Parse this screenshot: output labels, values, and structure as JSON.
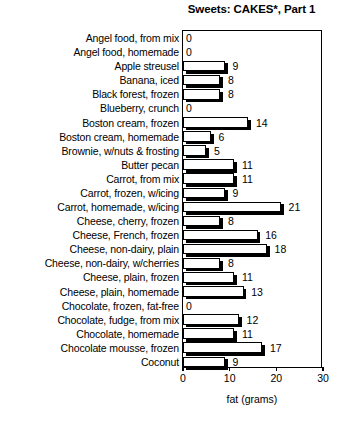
{
  "chart_data": {
    "type": "bar",
    "orientation": "horizontal",
    "title": "Sweets: CAKES*, Part 1",
    "xlabel": "fat (grams)",
    "ylabel": "",
    "xlim": [
      0,
      30
    ],
    "xticks": [
      0,
      10,
      20,
      30
    ],
    "xticklabels": [
      "0",
      "10",
      "20",
      "30"
    ],
    "grid": false,
    "legend": null,
    "categories": [
      "Angel food, from mix",
      "Angel food, homemade",
      "Apple streusel",
      "Banana, iced",
      "Black forest, frozen",
      "Blueberry, crunch",
      "Boston cream, frozen",
      "Boston cream, homemade",
      "Brownie, w/nuts & frosting",
      "Butter pecan",
      "Carrot, from mix",
      "Carrot, frozen, w/icing",
      "Carrot, homemade, w/icing",
      "Cheese, cherry, frozen",
      "Cheese, French, frozen",
      "Cheese, non-dairy, plain",
      "Cheese, non-dairy, w/cherries",
      "Cheese, plain, frozen",
      "Cheese, plain, homemade",
      "Chocolate, frozen, fat-free",
      "Chocolate, fudge, from mix",
      "Chocolate, homemade",
      "Chocolate mousse, frozen",
      "Coconut"
    ],
    "values": [
      0,
      0,
      9,
      8,
      8,
      0,
      14,
      6,
      5,
      11,
      11,
      9,
      21,
      8,
      16,
      18,
      8,
      11,
      13,
      0,
      12,
      11,
      17,
      9
    ],
    "value_labels": [
      "0",
      "0",
      "9",
      "8",
      "8",
      "0",
      "14",
      "6",
      "5",
      "11",
      "11",
      "9",
      "21",
      "8",
      "16",
      "18",
      "8",
      "11",
      "13",
      "0",
      "12",
      "11",
      "17",
      "9"
    ]
  },
  "colors": {
    "bar_fill": "#ffffff",
    "bar_edge": "#000000",
    "bar_shadow": "#000000",
    "background": "#ffffff",
    "text": "#000000"
  }
}
